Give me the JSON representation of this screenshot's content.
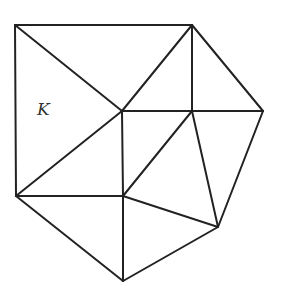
{
  "diagram": {
    "type": "triangulation-mesh",
    "stroke_color": "#222222",
    "background_color": "#ffffff",
    "vertices": {
      "A": [
        15,
        25
      ],
      "B": [
        192,
        25
      ],
      "C": [
        122,
        111
      ],
      "D": [
        192,
        111
      ],
      "E": [
        263,
        111
      ],
      "F": [
        16,
        196
      ],
      "G": [
        123,
        196
      ],
      "H": [
        218,
        227
      ],
      "I": [
        123,
        281
      ]
    },
    "edges": [
      [
        "A",
        "B"
      ],
      [
        "A",
        "F"
      ],
      [
        "A",
        "C"
      ],
      [
        "B",
        "C"
      ],
      [
        "B",
        "D"
      ],
      [
        "B",
        "E"
      ],
      [
        "C",
        "D"
      ],
      [
        "D",
        "E"
      ],
      [
        "C",
        "F"
      ],
      [
        "C",
        "G"
      ],
      [
        "F",
        "G"
      ],
      [
        "D",
        "G"
      ],
      [
        "D",
        "H"
      ],
      [
        "E",
        "H"
      ],
      [
        "G",
        "H"
      ],
      [
        "F",
        "I"
      ],
      [
        "G",
        "I"
      ],
      [
        "I",
        "H"
      ]
    ],
    "labels": [
      {
        "text": "K",
        "x": 37,
        "y": 101,
        "element": "triangle A-C-F"
      }
    ]
  }
}
